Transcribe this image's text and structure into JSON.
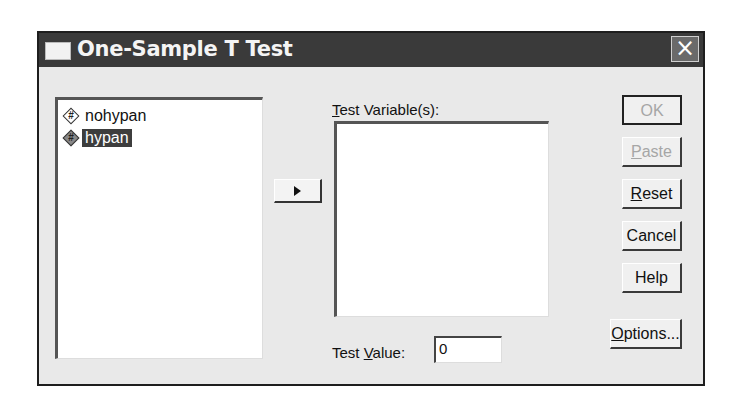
{
  "dialog": {
    "title": "One-Sample T Test",
    "close_icon": "×"
  },
  "variables": [
    {
      "name": "nohypan",
      "icon": "numeric-scale-icon",
      "selected": false
    },
    {
      "name": "hypan",
      "icon": "numeric-scale-icon",
      "selected": true
    }
  ],
  "move_button": {
    "icon": "right-arrow-icon"
  },
  "test_variables": {
    "label_mnemonic": "T",
    "label_rest": "est Variable(s):",
    "items": []
  },
  "test_value": {
    "label_pre": "Test ",
    "label_mnemonic": "V",
    "label_post": "alue:",
    "value": "0"
  },
  "buttons": {
    "ok": {
      "label": "OK",
      "enabled": false
    },
    "paste": {
      "mnemonic": "P",
      "rest": "aste",
      "enabled": false
    },
    "reset": {
      "mnemonic": "R",
      "rest": "eset",
      "enabled": true
    },
    "cancel": {
      "label": "Cancel",
      "enabled": true
    },
    "help": {
      "label": "Help",
      "enabled": true
    },
    "options": {
      "mnemonic": "O",
      "rest": "ptions...",
      "enabled": true
    }
  }
}
